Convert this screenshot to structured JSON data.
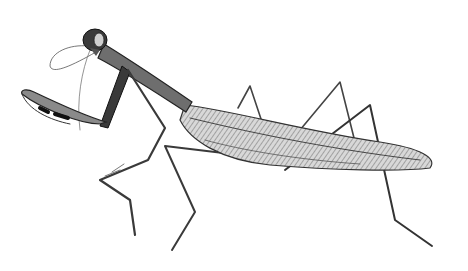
{
  "image": {
    "subject": "praying mantis illustration",
    "style": "monochrome pencil drawing",
    "background_color": "#ffffff",
    "ink_color": "#2a2a2a"
  }
}
